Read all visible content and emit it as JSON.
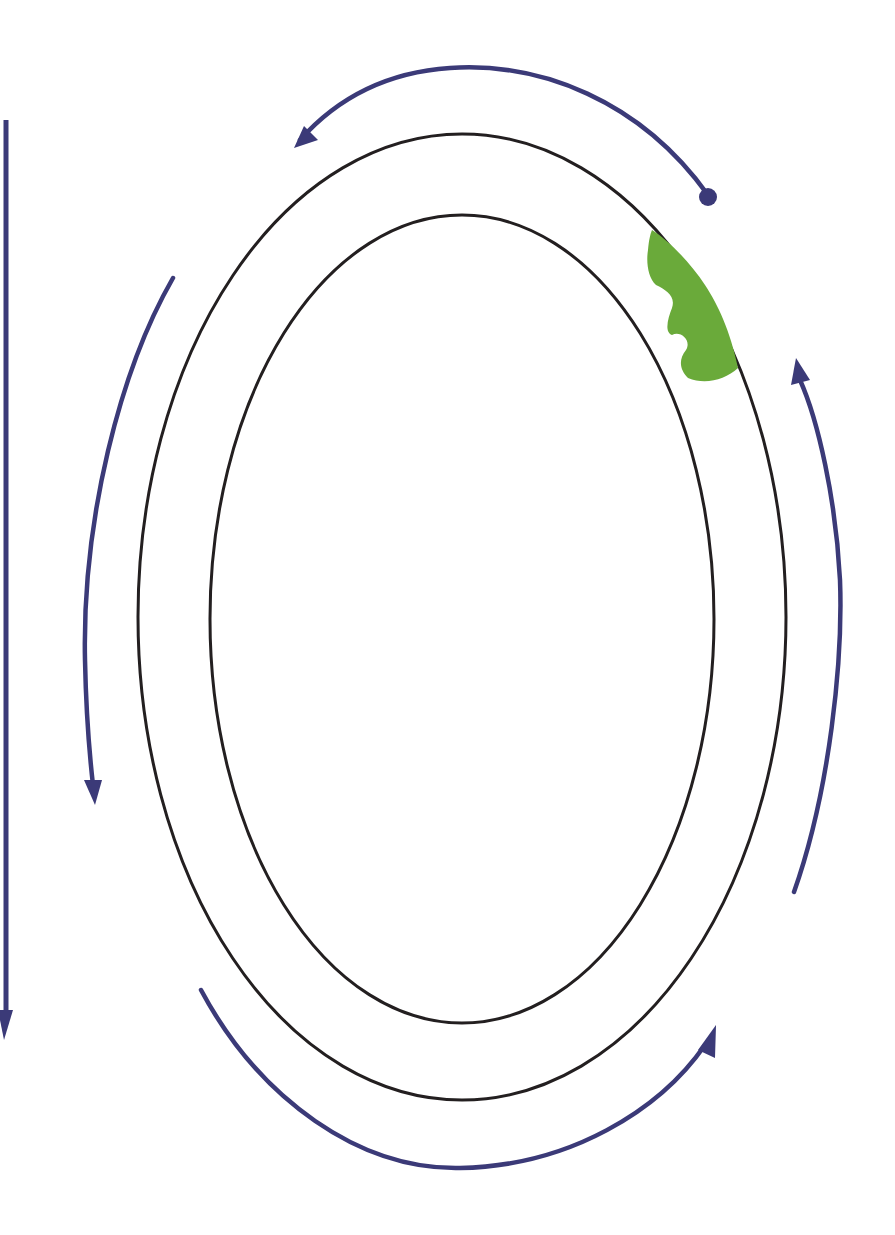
{
  "diagram": {
    "type": "concentric-ellipses-with-circulation-arrows",
    "colors": {
      "background": "#ffffff",
      "ring": "#231f20",
      "arrow": "#3b3a78",
      "blob": "#6aaa3a"
    },
    "rings": [
      {
        "name": "outer-ellipse",
        "cx": 462,
        "cy": 617,
        "rx": 324,
        "ry": 483
      },
      {
        "name": "inner-ellipse",
        "cx": 462,
        "cy": 619,
        "rx": 252,
        "ry": 404
      }
    ],
    "arrows": [
      {
        "name": "top-arrow",
        "direction": "counterclockwise",
        "from": "right-dot",
        "to": "upper-left"
      },
      {
        "name": "left-arrow",
        "direction": "down"
      },
      {
        "name": "bottom-arrow",
        "direction": "counterclockwise",
        "to": "lower-right"
      },
      {
        "name": "right-arrow",
        "direction": "up"
      },
      {
        "name": "left-edge-line",
        "direction": "down"
      }
    ],
    "start_marker": {
      "name": "start-dot",
      "x": 708,
      "y": 197
    },
    "blob": {
      "name": "green-region",
      "location": "upper-right, between rings"
    },
    "text": []
  }
}
